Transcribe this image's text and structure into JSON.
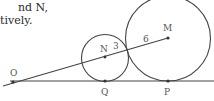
{
  "text": {
    "line1": "nd N,",
    "line2": "tively."
  },
  "diagram": {
    "points": {
      "O": {
        "label": "O",
        "x": 13,
        "y": 82
      },
      "N": {
        "label": "N",
        "x": 105,
        "y": 57
      },
      "M": {
        "label": "M",
        "x": 168,
        "y": 38
      },
      "Q": {
        "label": "Q",
        "x": 105,
        "y": 81
      },
      "P": {
        "label": "P",
        "x": 168,
        "y": 81
      }
    },
    "segment_labels": {
      "NT": "3",
      "TM": "6"
    },
    "circles": [
      {
        "name": "small",
        "center": "N",
        "radius": 24
      },
      {
        "name": "large",
        "center": "M",
        "radius": 43
      }
    ],
    "colors": {
      "stroke": "#444444",
      "label": "#555555"
    }
  }
}
